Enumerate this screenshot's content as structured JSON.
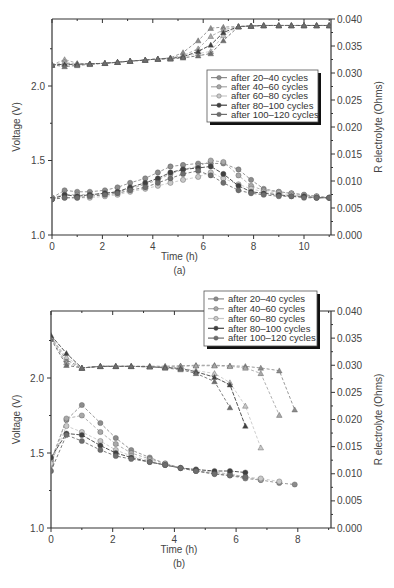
{
  "chart_data": [
    {
      "id": "a",
      "type": "line",
      "panel_label": "(a)",
      "title": "",
      "xlabel": "Time (h)",
      "ylabel": "Voltage (V)",
      "y2label": "R electrolyte (Ohms)",
      "xlim": [
        0,
        11
      ],
      "ylim": [
        1.0,
        2.45
      ],
      "y2lim": [
        0.0,
        0.04
      ],
      "xticks": [
        "0",
        "2",
        "4",
        "6",
        "8",
        "10"
      ],
      "yticks": [
        "1.0",
        "1.5",
        "2.0"
      ],
      "y2ticks": [
        "0.000",
        "0.005",
        "0.010",
        "0.015",
        "0.020",
        "0.025",
        "0.030",
        "0.035",
        "0.040"
      ],
      "grid": false,
      "legend_position": "upper right (inside)",
      "legend": [
        "after 20–40 cycles",
        "after 40–60 cycles",
        "after 60–80 cycles",
        "after 80–100 cycles",
        "after 100–120 cycles"
      ],
      "x": [
        0,
        0.5,
        1.0,
        1.5,
        2.1,
        2.6,
        3.1,
        3.7,
        4.2,
        4.7,
        5.2,
        5.8,
        6.3,
        6.8,
        7.4,
        7.9,
        8.4,
        9.0,
        9.5,
        10.0,
        10.5,
        11.0
      ],
      "voltage_series": [
        {
          "name": "after 20–40 cycles",
          "values": [
            1.25,
            1.3,
            1.29,
            1.29,
            1.3,
            1.32,
            1.35,
            1.38,
            1.42,
            1.46,
            1.47,
            1.48,
            1.48,
            1.48,
            1.44,
            1.37,
            1.31,
            1.29,
            1.28,
            1.27,
            1.26,
            1.25
          ]
        },
        {
          "name": "after 40–60 cycles",
          "values": [
            1.25,
            1.27,
            1.27,
            1.27,
            1.28,
            1.29,
            1.31,
            1.34,
            1.37,
            1.41,
            1.44,
            1.46,
            1.5,
            1.49,
            1.4,
            1.33,
            1.3,
            1.29,
            1.28,
            1.27,
            1.26,
            1.25
          ]
        },
        {
          "name": "after 60–80 cycles",
          "values": [
            1.24,
            1.25,
            1.25,
            1.25,
            1.26,
            1.27,
            1.29,
            1.31,
            1.33,
            1.35,
            1.37,
            1.39,
            1.42,
            1.38,
            1.34,
            1.31,
            1.29,
            1.28,
            1.27,
            1.26,
            1.25,
            1.25
          ]
        },
        {
          "name": "after 80–100 cycles",
          "values": [
            1.24,
            1.27,
            1.26,
            1.27,
            1.28,
            1.29,
            1.32,
            1.35,
            1.38,
            1.42,
            1.44,
            1.45,
            1.46,
            1.41,
            1.33,
            1.29,
            1.28,
            1.27,
            1.26,
            1.26,
            1.25,
            1.25
          ]
        },
        {
          "name": "after 100–120 cycles",
          "values": [
            1.24,
            1.25,
            1.25,
            1.26,
            1.27,
            1.28,
            1.3,
            1.32,
            1.35,
            1.38,
            1.41,
            1.43,
            1.4,
            1.35,
            1.3,
            1.28,
            1.27,
            1.26,
            1.26,
            1.25,
            1.25,
            1.25
          ]
        }
      ],
      "r_electrolyte_series": [
        {
          "name": "after 20–40 cycles",
          "values": [
            0.0315,
            0.0318,
            0.0316,
            0.0317,
            0.0318,
            0.032,
            0.0322,
            0.0324,
            0.0326,
            0.0328,
            0.0338,
            0.036,
            0.0383,
            0.0385,
            0.0386,
            0.0387,
            0.0388,
            0.0388,
            0.0388,
            0.0388,
            0.0388,
            0.0388
          ]
        },
        {
          "name": "after 40–60 cycles",
          "values": [
            0.0315,
            0.0325,
            0.0318,
            0.0317,
            0.0318,
            0.032,
            0.0322,
            0.0324,
            0.0326,
            0.0328,
            0.0332,
            0.0345,
            0.0368,
            0.038,
            0.0386,
            0.0387,
            0.0388,
            0.0388,
            0.0388,
            0.0388,
            0.0388,
            0.0388
          ]
        },
        {
          "name": "after 60–80 cycles",
          "values": [
            0.0315,
            0.032,
            0.0317,
            0.0317,
            0.0318,
            0.032,
            0.0322,
            0.0324,
            0.0326,
            0.0327,
            0.033,
            0.0336,
            0.034,
            0.037,
            0.0386,
            0.0387,
            0.0388,
            0.0388,
            0.0388,
            0.0388,
            0.0388,
            0.0388
          ]
        },
        {
          "name": "after 80–100 cycles",
          "values": [
            0.0315,
            0.0316,
            0.0316,
            0.0317,
            0.0318,
            0.032,
            0.0322,
            0.0324,
            0.0326,
            0.0327,
            0.033,
            0.034,
            0.0352,
            0.0375,
            0.0386,
            0.0387,
            0.0388,
            0.0388,
            0.0388,
            0.0388,
            0.0388,
            0.0388
          ]
        },
        {
          "name": "after 100–120 cycles",
          "values": [
            0.0315,
            0.0312,
            0.0314,
            0.0316,
            0.0318,
            0.032,
            0.0322,
            0.0324,
            0.0326,
            0.0326,
            0.0328,
            0.0332,
            0.0336,
            0.036,
            0.0386,
            0.0387,
            0.0388,
            0.0388,
            0.0388,
            0.0388,
            0.0388,
            0.0388
          ]
        }
      ]
    },
    {
      "id": "b",
      "type": "line",
      "panel_label": "(b)",
      "title": "",
      "xlabel": "Time (h)",
      "ylabel": "Voltage (V)",
      "y2label": "R electrolyte (Ohms)",
      "xlim": [
        0,
        9
      ],
      "ylim": [
        1.0,
        2.45
      ],
      "y2lim": [
        0.0,
        0.04
      ],
      "xticks": [
        "0",
        "2",
        "4",
        "6",
        "8"
      ],
      "yticks": [
        "1.0",
        "1.5",
        "2.0"
      ],
      "y2ticks": [
        "0.000",
        "0.005",
        "0.010",
        "0.015",
        "0.020",
        "0.025",
        "0.030",
        "0.035",
        "0.040"
      ],
      "grid": false,
      "legend_position": "upper right (above plot)",
      "legend": [
        "after 20–40 cycles",
        "after 40–60 cycles",
        "after 60–80 cycles",
        "after 80–100 cycles",
        "after 100–120 cycles"
      ],
      "voltage_series": [
        {
          "name": "after 20–40 cycles",
          "x": [
            0,
            0.5,
            1.0,
            1.6,
            2.1,
            2.6,
            3.2,
            3.7,
            4.2,
            4.7,
            5.3,
            5.8,
            6.3,
            6.8,
            7.4,
            7.9
          ],
          "values": [
            1.45,
            1.72,
            1.82,
            1.7,
            1.6,
            1.52,
            1.47,
            1.43,
            1.4,
            1.38,
            1.36,
            1.35,
            1.33,
            1.32,
            1.3,
            1.29
          ]
        },
        {
          "name": "after 40–60 cycles",
          "x": [
            0,
            0.5,
            1.0,
            1.6,
            2.1,
            2.6,
            3.2,
            3.7,
            4.2,
            4.7,
            5.3,
            5.8,
            6.3,
            6.8
          ],
          "values": [
            1.42,
            1.73,
            1.75,
            1.64,
            1.56,
            1.5,
            1.46,
            1.43,
            1.4,
            1.38,
            1.37,
            1.36,
            1.34,
            1.32
          ]
        },
        {
          "name": "after 60–80 cycles",
          "x": [
            0,
            0.5,
            1.0,
            1.6,
            2.1,
            2.6,
            3.2,
            3.7,
            4.2,
            4.7,
            5.3,
            5.8,
            6.3,
            6.8,
            7.4
          ],
          "values": [
            1.43,
            1.68,
            1.64,
            1.58,
            1.52,
            1.48,
            1.45,
            1.42,
            1.4,
            1.39,
            1.37,
            1.36,
            1.34,
            1.33,
            1.31
          ]
        },
        {
          "name": "after 80–100 cycles",
          "x": [
            0,
            0.5,
            1.0,
            1.6,
            2.1,
            2.6,
            3.2,
            3.7,
            4.2,
            4.7,
            5.3,
            5.8,
            6.3
          ],
          "values": [
            1.47,
            1.63,
            1.62,
            1.55,
            1.5,
            1.47,
            1.44,
            1.42,
            1.4,
            1.39,
            1.38,
            1.38,
            1.37
          ]
        },
        {
          "name": "after 100–120 cycles",
          "x": [
            0,
            0.5,
            1.0,
            1.6,
            2.1,
            2.6,
            3.2,
            3.7,
            4.2,
            4.7,
            5.3,
            5.8,
            6.3
          ],
          "values": [
            1.38,
            1.62,
            1.58,
            1.52,
            1.48,
            1.46,
            1.44,
            1.42,
            1.4,
            1.38,
            1.36,
            1.35,
            1.34
          ]
        }
      ],
      "r_electrolyte_series": [
        {
          "name": "after 20–40 cycles",
          "x": [
            0,
            0.5,
            1.0,
            1.6,
            2.1,
            2.6,
            3.2,
            3.7,
            4.2,
            4.7,
            5.3,
            5.8,
            6.3,
            6.8,
            7.4,
            7.9
          ],
          "values": [
            0.0352,
            0.031,
            0.0295,
            0.0298,
            0.0298,
            0.0298,
            0.0298,
            0.0298,
            0.0299,
            0.03,
            0.03,
            0.0299,
            0.0298,
            0.0295,
            0.029,
            0.0218
          ]
        },
        {
          "name": "after 40–60 cycles",
          "x": [
            0,
            0.5,
            1.0,
            1.6,
            2.1,
            2.6,
            3.2,
            3.7,
            4.2,
            4.7,
            5.3,
            5.8,
            6.3,
            6.8,
            7.4
          ],
          "values": [
            0.035,
            0.0305,
            0.0295,
            0.0298,
            0.0298,
            0.0298,
            0.0298,
            0.0298,
            0.0298,
            0.0299,
            0.0299,
            0.0298,
            0.0295,
            0.0285,
            0.0208
          ]
        },
        {
          "name": "after 60–80 cycles",
          "x": [
            0,
            0.5,
            1.0,
            1.6,
            2.1,
            2.6,
            3.2,
            3.7,
            4.2,
            4.7,
            5.3,
            5.8,
            6.3,
            6.8
          ],
          "values": [
            0.0352,
            0.0315,
            0.0295,
            0.0298,
            0.0298,
            0.0298,
            0.0298,
            0.0296,
            0.0295,
            0.029,
            0.0285,
            0.0268,
            0.0225,
            0.0148
          ]
        },
        {
          "name": "after 80–100 cycles",
          "x": [
            0,
            0.5,
            1.0,
            1.6,
            2.1,
            2.6,
            3.2,
            3.7,
            4.2,
            4.7,
            5.3,
            5.8,
            6.3
          ],
          "values": [
            0.0355,
            0.0322,
            0.0295,
            0.0298,
            0.0298,
            0.0298,
            0.0297,
            0.0296,
            0.0294,
            0.0288,
            0.0278,
            0.0264,
            0.0188
          ]
        },
        {
          "name": "after 100–120 cycles",
          "x": [
            0,
            0.5,
            1.0,
            1.6,
            2.1,
            2.6,
            3.2,
            3.7,
            4.2,
            4.7,
            5.3,
            5.8
          ],
          "values": [
            0.0348,
            0.03,
            0.0295,
            0.0298,
            0.0298,
            0.0298,
            0.0297,
            0.0295,
            0.0292,
            0.0285,
            0.027,
            0.0222
          ]
        }
      ]
    }
  ],
  "series_colors": [
    "#8c8c8c",
    "#a8a8a8",
    "#c8c8c8",
    "#404040",
    "#6e6e6e"
  ],
  "series_markers_voltage": "circle",
  "series_markers_r": "triangle"
}
